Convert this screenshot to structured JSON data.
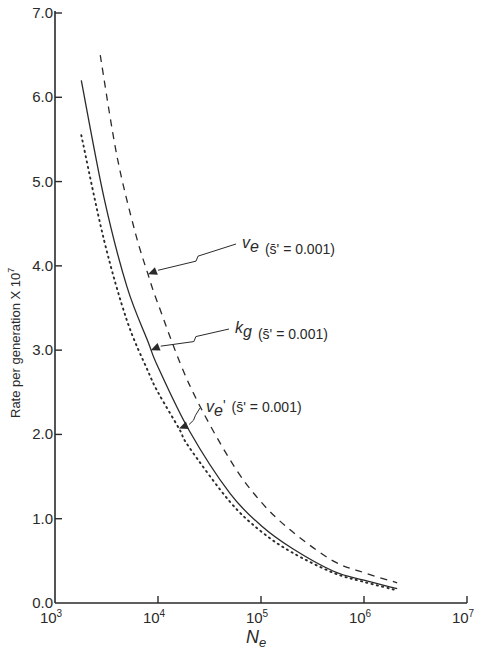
{
  "chart_data": {
    "type": "line",
    "title": "",
    "xlabel": "N_e",
    "xlabel_main": "N",
    "xlabel_sub": "e",
    "ylabel": "Rate per generation X 10^7",
    "ylabel_text": "Rate per generation X 10",
    "ylabel_exp": "7",
    "xscale": "log",
    "xlim": [
      1000,
      10000000
    ],
    "ylim": [
      0.0,
      7.0
    ],
    "grid": false,
    "legend": "none (inline annotations with arrows)",
    "x_ticks": [
      {
        "base": "10",
        "exp": "3",
        "value": 1000
      },
      {
        "base": "10",
        "exp": "4",
        "value": 10000
      },
      {
        "base": "10",
        "exp": "5",
        "value": 100000
      },
      {
        "base": "10",
        "exp": "6",
        "value": 1000000
      },
      {
        "base": "10",
        "exp": "7",
        "value": 10000000
      }
    ],
    "y_ticks": [
      "0.0",
      "1.0",
      "2.0",
      "3.0",
      "4.0",
      "5.0",
      "6.0",
      "7.0"
    ],
    "series": [
      {
        "name": "v_e (s̄' = 0.001)",
        "style": "dashed",
        "x": [
          2750,
          4000,
          6000,
          8000,
          10000,
          20000,
          50000,
          100000,
          200000,
          500000,
          1000000,
          2100000
        ],
        "values": [
          6.5,
          5.3,
          4.4,
          3.9,
          3.55,
          2.6,
          1.7,
          1.2,
          0.85,
          0.5,
          0.36,
          0.24
        ]
      },
      {
        "name": "k_g (s̄' = 0.001)",
        "style": "solid",
        "x": [
          1800,
          3000,
          5000,
          8000,
          10000,
          20000,
          50000,
          100000,
          200000,
          500000,
          1000000,
          2100000
        ],
        "values": [
          6.2,
          4.8,
          3.75,
          3.1,
          2.8,
          2.05,
          1.3,
          0.92,
          0.65,
          0.38,
          0.27,
          0.17
        ]
      },
      {
        "name": "v_e' (s̄' = 0.001)",
        "style": "dotted",
        "x": [
          1800,
          3000,
          5000,
          8000,
          10000,
          16000,
          20000,
          50000,
          100000,
          200000,
          500000,
          1000000,
          2100000
        ],
        "values": [
          5.55,
          4.3,
          3.35,
          2.75,
          2.5,
          2.07,
          1.85,
          1.2,
          0.85,
          0.6,
          0.36,
          0.25,
          0.15
        ]
      }
    ],
    "annotations": [
      {
        "symbol": "v",
        "sub": "e",
        "prime": "",
        "text": "(s̄' = 0.001)",
        "points_to": "dashed curve",
        "at_x": 8000,
        "at_y": 3.9
      },
      {
        "symbol": "k",
        "sub": "g",
        "prime": "",
        "text": "(s̄' = 0.001)",
        "points_to": "solid curve",
        "at_x": 8500,
        "at_y": 3.0
      },
      {
        "symbol": "v",
        "sub": "e",
        "prime": "'",
        "text": "(s̄' = 0.001)",
        "points_to": "dotted curve",
        "at_x": 16000,
        "at_y": 2.07
      }
    ]
  },
  "colors": {
    "ink": "#2a2a2a",
    "background": "#ffffff"
  }
}
